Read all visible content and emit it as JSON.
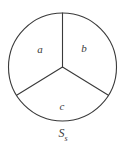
{
  "figure": {
    "type": "circle-divided-into-three-sectors",
    "caption": {
      "base": "S",
      "subscript": "s"
    },
    "stroke_color": "#3a3a3a",
    "fill_color": "#ffffff",
    "background_color": "#ffffff",
    "circle": {
      "center_x": 62.5,
      "center_y": 67,
      "radius": 54
    },
    "sectors": [
      {
        "id": "sector-a",
        "label": "a",
        "label_x": 40,
        "label_y": 49
      },
      {
        "id": "sector-b",
        "label": "b",
        "label_x": 84,
        "label_y": 48
      },
      {
        "id": "sector-c",
        "label": "c",
        "label_x": 62,
        "label_y": 106
      }
    ],
    "radii": [
      {
        "id": "radius-top",
        "x2": 62.5,
        "y2": 13
      },
      {
        "id": "radius-lower-left",
        "x2": 17,
        "y2": 95
      },
      {
        "id": "radius-lower-right",
        "x2": 108,
        "y2": 95
      }
    ]
  }
}
